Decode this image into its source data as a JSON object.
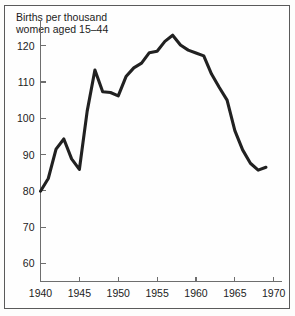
{
  "caption": {
    "line1": "Births per thousand",
    "line2": "women aged 15–44"
  },
  "chart_data": {
    "type": "line",
    "title": "Births per thousand women aged 15–44",
    "xlabel": "",
    "ylabel": "Births per thousand women aged 15–44",
    "xlim": [
      1940,
      1971
    ],
    "ylim": [
      55,
      126
    ],
    "grid": false,
    "legend": "none",
    "xticks": [
      1940,
      1945,
      1950,
      1955,
      1960,
      1965,
      1970
    ],
    "xticklabels": [
      "1940",
      "1945",
      "1950",
      "1955",
      "1960",
      "1965",
      "1970"
    ],
    "yticks": [
      60,
      70,
      80,
      90,
      100,
      110,
      120
    ],
    "yticklabels": [
      "60",
      "70",
      "80",
      "90",
      "100",
      "110",
      "120"
    ],
    "line_color": "#212121",
    "x": [
      1940,
      1941,
      1942,
      1943,
      1944,
      1945,
      1946,
      1947,
      1948,
      1949,
      1950,
      1951,
      1952,
      1953,
      1954,
      1955,
      1956,
      1957,
      1958,
      1959,
      1960,
      1961,
      1962,
      1963,
      1964,
      1965,
      1966,
      1967,
      1968,
      1969
    ],
    "values": [
      79.9,
      83.4,
      91.5,
      94.3,
      88.8,
      85.9,
      101.9,
      113.3,
      107.3,
      107.1,
      106.2,
      111.5,
      113.9,
      115.2,
      118.1,
      118.5,
      121.2,
      122.9,
      120.2,
      118.8,
      118.0,
      117.2,
      112.2,
      108.5,
      105.0,
      96.6,
      91.3,
      87.6,
      85.7,
      86.5
    ],
    "annotations": [
      {
        "text": "wartime dip",
        "year": 1945,
        "value": 85.9
      },
      {
        "text": "postwar spike",
        "year": 1947,
        "value": 113.3
      },
      {
        "text": "baby boom peak",
        "year": 1957,
        "value": 122.9
      },
      {
        "text": "decline",
        "year": 1969,
        "value": 86.5
      }
    ]
  }
}
